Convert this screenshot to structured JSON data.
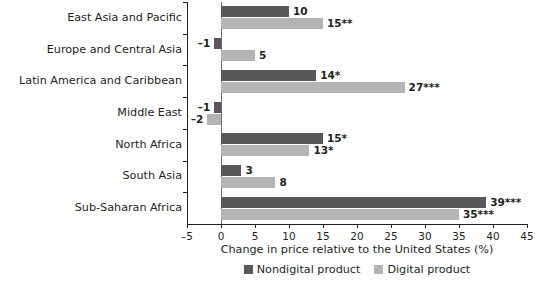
{
  "chart_data": {
    "type": "bar",
    "orientation": "horizontal",
    "title": "",
    "xlabel": "Change in price relative to the United States (%)",
    "ylabel": "",
    "xlim": [
      -5,
      45
    ],
    "xticks": [
      -5,
      0,
      5,
      10,
      15,
      20,
      25,
      30,
      35,
      40,
      45
    ],
    "xtick_labels": [
      "–5",
      "0",
      "5",
      "10",
      "15",
      "20",
      "25",
      "30",
      "35",
      "40",
      "45"
    ],
    "grid": false,
    "legend_position": "bottom-center",
    "categories": [
      "East Asia and Pacific",
      "Europe and Central Asia",
      "Latin America and Caribbean",
      "Middle East",
      "North Africa",
      "South Asia",
      "Sub-Saharan Africa"
    ],
    "series": [
      {
        "name": "Nondigital product",
        "color": "#58585b",
        "values": [
          10,
          -1,
          14,
          -1,
          15,
          3,
          39
        ],
        "labels": [
          "10",
          "–1",
          "14*",
          "–1",
          "15*",
          "3",
          "39***"
        ]
      },
      {
        "name": "Digital product",
        "color": "#b4b4b4",
        "values": [
          15,
          5,
          27,
          -2,
          13,
          8,
          35
        ],
        "labels": [
          "15**",
          "5",
          "27***",
          "–2",
          "13*",
          "8",
          "35***"
        ]
      }
    ]
  },
  "legend": {
    "items": [
      {
        "label": "Nondigital product",
        "color": "#58585b"
      },
      {
        "label": "Digital product",
        "color": "#b4b4b4"
      }
    ]
  }
}
